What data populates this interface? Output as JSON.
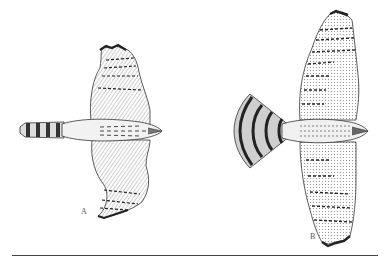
{
  "figure": {
    "labels": {
      "a": "A",
      "b": "B"
    },
    "colors": {
      "ink": "#222222",
      "shade": "#777777",
      "light": "#bbbbbb",
      "background": "#ffffff",
      "rule": "#444444"
    }
  }
}
